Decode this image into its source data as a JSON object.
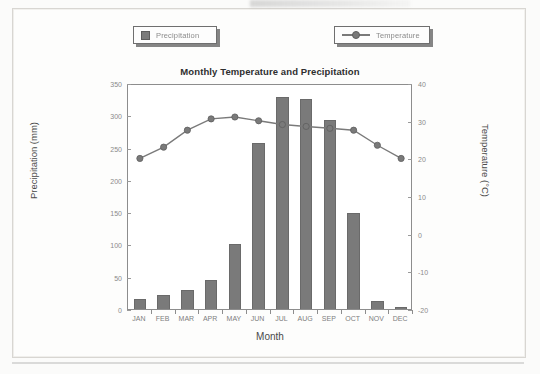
{
  "legend": {
    "position": "top",
    "items": [
      {
        "label": "Precipitation",
        "icon": "square-swatch-icon",
        "color": "#7a7a7a"
      },
      {
        "label": "Temperature",
        "icon": "line-marker-swatch-icon",
        "color": "#7a7a7a"
      }
    ]
  },
  "chart_data": {
    "type": "bar",
    "title": "Monthly Temperature and Precipitation",
    "xlabel": "Month",
    "ylabel": "Precipitation (mm)",
    "y2label": "Temperature (°C)",
    "categories": [
      "JAN",
      "FEB",
      "MAR",
      "APR",
      "MAY",
      "JUN",
      "JUL",
      "AUG",
      "SEP",
      "OCT",
      "NOV",
      "DEC"
    ],
    "ylim": [
      0,
      350
    ],
    "y2lim": [
      -20,
      40
    ],
    "yticks": [
      0,
      50,
      100,
      150,
      200,
      250,
      300,
      350
    ],
    "ytick_labels": [
      "0",
      "50",
      "100",
      "150",
      "200",
      "250",
      "300",
      "350"
    ],
    "y2ticks": [
      -20,
      -10,
      0,
      10,
      20,
      30,
      40
    ],
    "y2tick_labels": [
      "-20",
      "-10",
      "0",
      "10",
      "20",
      "30",
      "40"
    ],
    "grid": false,
    "legend_position": "top",
    "series": [
      {
        "name": "Precipitation",
        "type": "bar",
        "axis": "left",
        "unit": "mm",
        "color": "#7a7a7a",
        "values": [
          15,
          21,
          30,
          45,
          100,
          257,
          329,
          326,
          293,
          149,
          13,
          3
        ]
      },
      {
        "name": "Temperature",
        "type": "line",
        "axis": "right",
        "unit": "°C",
        "color": "#7a7a7a",
        "marker": "circle",
        "values": [
          20.5,
          23.5,
          28.0,
          31.0,
          31.5,
          30.5,
          29.5,
          29.0,
          28.5,
          28.0,
          24.0,
          20.5
        ]
      }
    ]
  }
}
